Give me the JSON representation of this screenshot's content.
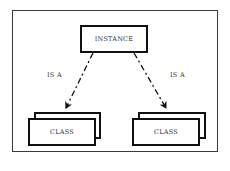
{
  "diagram": {
    "instance_box": {
      "label": "INSTANCE"
    },
    "edges": [
      {
        "from": "INSTANCE",
        "to": "CLASS (left)",
        "label": "IS A",
        "style": "dashed-arrow"
      },
      {
        "from": "INSTANCE",
        "to": "CLASS (right)",
        "label": "IS A",
        "style": "dashed-arrow"
      }
    ],
    "class_boxes": [
      {
        "label": "CLASS",
        "stacked": true
      },
      {
        "label": "CLASS",
        "stacked": true
      }
    ]
  },
  "colors": {
    "line": "#111111",
    "text": "#333333",
    "background": "#ffffff"
  }
}
